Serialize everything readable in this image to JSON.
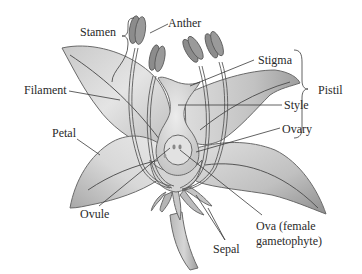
{
  "diagram": {
    "labels": {
      "stamen": "Stamen",
      "anther": "Anther",
      "stigma": "Stigma",
      "pistil": "Pistil",
      "filament": "Filament",
      "style": "Style",
      "ovary": "Ovary",
      "petal": "Petal",
      "ovule": "Ovule",
      "ova_line1": "Ova (female",
      "ova_line2": "gametophyte)",
      "sepal": "Sepal"
    },
    "groupings": {
      "stamen": [
        "Anther",
        "Filament"
      ],
      "pistil": [
        "Stigma",
        "Style",
        "Ovary"
      ]
    },
    "colors": {
      "petal_light": "#e6e6e6",
      "petal_dark": "#a9a9a9",
      "anther": "#8c8c8c",
      "pistil": "#c4c4c4",
      "text": "#2a2a2a",
      "background": "#ffffff"
    }
  }
}
